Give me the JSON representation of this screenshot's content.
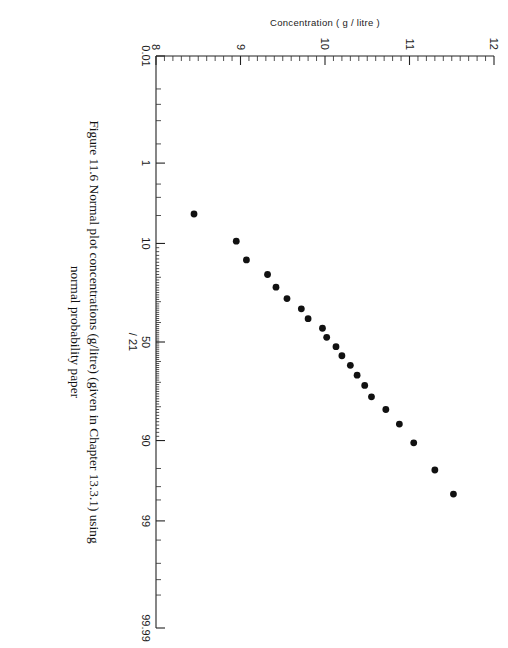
{
  "figure": {
    "caption_line1": "Figure 11.6 Normal plot concentrations (g/litre) (given in Chapter 13.3.1) using",
    "caption_line2": "normal probability paper",
    "annotation": "/ 21"
  },
  "chart_data": {
    "type": "scatter",
    "title": "",
    "xlabel": "",
    "ylabel": "Concentration ( g / litre )",
    "x_axis": {
      "name": "cumulative-probability",
      "scale": "normal-probability",
      "unit": "%",
      "ticklabels": [
        "0.01",
        "1",
        "10",
        "50",
        "90",
        "99",
        "99.99"
      ],
      "tickvalues": [
        0.01,
        1,
        10,
        50,
        90,
        99,
        99.99
      ],
      "minor_ticks": [
        0.05,
        0.1,
        0.2,
        0.5,
        2,
        3,
        5,
        20,
        30,
        40,
        60,
        70,
        80,
        95,
        97,
        98,
        99.5,
        99.8,
        99.9,
        99.95
      ],
      "range": [
        0.01,
        99.99
      ],
      "grid": false
    },
    "y_axis": {
      "name": "concentration",
      "scale": "linear",
      "unit": "g/litre",
      "ticklabels": [
        "8",
        "9",
        "10",
        "11",
        "12"
      ],
      "tickvalues": [
        8,
        9,
        10,
        11,
        12
      ],
      "minor_tick_step": 0.1,
      "range": [
        8,
        12
      ],
      "grid": false
    },
    "legend": null,
    "n_points": 21,
    "points": [
      {
        "probability": 4.8,
        "concentration": 8.45
      },
      {
        "probability": 9.5,
        "concentration": 8.95
      },
      {
        "probability": 14.3,
        "concentration": 9.07
      },
      {
        "probability": 19.0,
        "concentration": 9.32
      },
      {
        "probability": 23.8,
        "concentration": 9.42
      },
      {
        "probability": 28.6,
        "concentration": 9.55
      },
      {
        "probability": 33.3,
        "concentration": 9.72
      },
      {
        "probability": 38.1,
        "concentration": 9.8
      },
      {
        "probability": 42.9,
        "concentration": 9.97
      },
      {
        "probability": 47.6,
        "concentration": 10.02
      },
      {
        "probability": 52.4,
        "concentration": 10.13
      },
      {
        "probability": 57.1,
        "concentration": 10.2
      },
      {
        "probability": 61.9,
        "concentration": 10.3
      },
      {
        "probability": 66.7,
        "concentration": 10.38
      },
      {
        "probability": 71.4,
        "concentration": 10.47
      },
      {
        "probability": 76.2,
        "concentration": 10.55
      },
      {
        "probability": 81.0,
        "concentration": 10.72
      },
      {
        "probability": 85.7,
        "concentration": 10.88
      },
      {
        "probability": 90.5,
        "concentration": 11.05
      },
      {
        "probability": 95.2,
        "concentration": 11.3
      },
      {
        "probability": 97.6,
        "concentration": 11.52
      }
    ]
  }
}
